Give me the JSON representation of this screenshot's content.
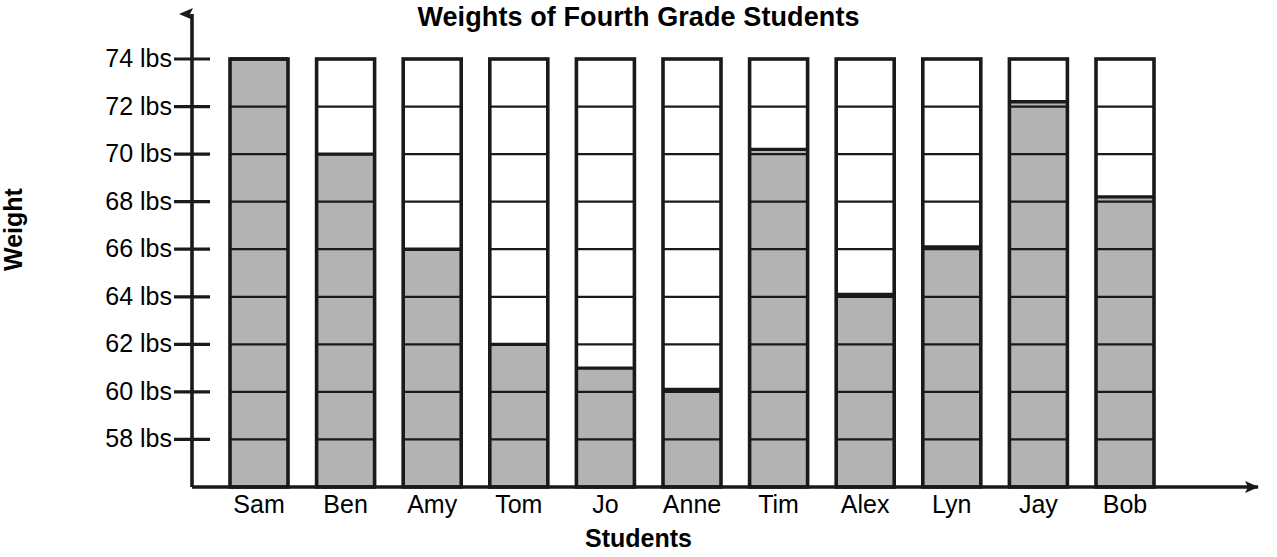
{
  "chart_data": {
    "type": "bar",
    "title": "Weights of Fourth Grade Students",
    "xlabel": "Students",
    "ylabel": "Weight",
    "categories": [
      "Sam",
      "Ben",
      "Amy",
      "Tom",
      "Jo",
      "Anne",
      "Tim",
      "Alex",
      "Lyn",
      "Jay",
      "Bob"
    ],
    "values": [
      74,
      70,
      66,
      62,
      61,
      60.1,
      70.2,
      64.1,
      66.1,
      72.2,
      68.2
    ],
    "value_labels": [
      "74 lbs",
      "70 lbs",
      "66 lbs",
      "62 lbs",
      "61 lbs",
      "60 lbs",
      "70 lbs",
      "64 lbs",
      "66 lbs",
      "72 lbs",
      "68 lbs"
    ],
    "ylim": [
      56,
      74
    ],
    "ytick_values": [
      58,
      60,
      62,
      64,
      66,
      68,
      70,
      72,
      74
    ],
    "ytick_labels": [
      "58 lbs",
      "60 lbs",
      "62 lbs",
      "64 lbs",
      "66 lbs",
      "68 lbs",
      "70 lbs",
      "72 lbs",
      "74 lbs"
    ],
    "bar_top_value": 74,
    "grid": true,
    "grid_orientation": "horizontal",
    "legend": null,
    "bar_fill_color": "#b3b3b3",
    "bar_empty_color": "#ffffff",
    "bar_outline_color": "#1a1a1a",
    "axis_color": "#1a1a1a",
    "background_color": "#ffffff"
  }
}
